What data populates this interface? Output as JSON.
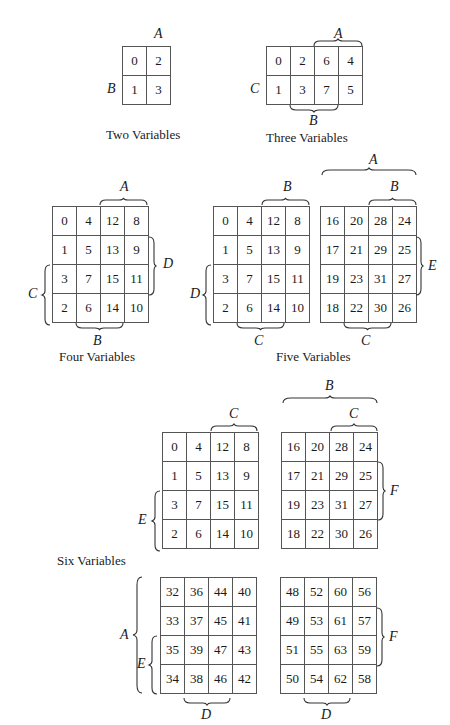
{
  "figure": {
    "two": {
      "caption": "Two Variables",
      "labels": {
        "top": "A",
        "left": "B"
      },
      "cells": [
        [
          "0",
          "2"
        ],
        [
          "1",
          "3"
        ]
      ]
    },
    "three": {
      "caption": "Three Variables",
      "labels": {
        "top": "A",
        "left": "C",
        "bottom": "B"
      },
      "cells": [
        [
          "0",
          "2",
          "6",
          "4"
        ],
        [
          "1",
          "3",
          "7",
          "5"
        ]
      ]
    },
    "four": {
      "caption": "Four Variables",
      "labels": {
        "top": "A",
        "right": "D",
        "left": "C",
        "bottom": "B"
      },
      "cells": [
        [
          "0",
          "4",
          "12",
          "8"
        ],
        [
          "1",
          "5",
          "13",
          "9"
        ],
        [
          "3",
          "7",
          "15",
          "11"
        ],
        [
          "2",
          "6",
          "14",
          "10"
        ]
      ]
    },
    "five": {
      "caption": "Five Variables",
      "labels": {
        "top_outer": "A",
        "top_left": "B",
        "top_right": "B",
        "left": "D",
        "right": "E",
        "bottom_left": "C",
        "bottom_right": "C"
      },
      "left_cells": [
        [
          "0",
          "4",
          "12",
          "8"
        ],
        [
          "1",
          "5",
          "13",
          "9"
        ],
        [
          "3",
          "7",
          "15",
          "11"
        ],
        [
          "2",
          "6",
          "14",
          "10"
        ]
      ],
      "right_cells": [
        [
          "16",
          "20",
          "28",
          "24"
        ],
        [
          "17",
          "21",
          "29",
          "25"
        ],
        [
          "19",
          "23",
          "31",
          "27"
        ],
        [
          "18",
          "22",
          "30",
          "26"
        ]
      ]
    },
    "six": {
      "caption": "Six Variables",
      "labels": {
        "top_outer": "B",
        "top_left": "C",
        "top_right": "C",
        "left_top": "E",
        "right_top": "F",
        "left_outer": "A",
        "left_bottom": "E",
        "right_bottom": "F",
        "bottom_left": "D",
        "bottom_right": "D"
      },
      "tl_cells": [
        [
          "0",
          "4",
          "12",
          "8"
        ],
        [
          "1",
          "5",
          "13",
          "9"
        ],
        [
          "3",
          "7",
          "15",
          "11"
        ],
        [
          "2",
          "6",
          "14",
          "10"
        ]
      ],
      "tr_cells": [
        [
          "16",
          "20",
          "28",
          "24"
        ],
        [
          "17",
          "21",
          "29",
          "25"
        ],
        [
          "19",
          "23",
          "31",
          "27"
        ],
        [
          "18",
          "22",
          "30",
          "26"
        ]
      ],
      "bl_cells": [
        [
          "32",
          "36",
          "44",
          "40"
        ],
        [
          "33",
          "37",
          "45",
          "41"
        ],
        [
          "35",
          "39",
          "47",
          "43"
        ],
        [
          "34",
          "38",
          "46",
          "42"
        ]
      ],
      "br_cells": [
        [
          "48",
          "52",
          "60",
          "56"
        ],
        [
          "49",
          "53",
          "61",
          "57"
        ],
        [
          "51",
          "55",
          "63",
          "59"
        ],
        [
          "50",
          "54",
          "62",
          "58"
        ]
      ]
    }
  }
}
